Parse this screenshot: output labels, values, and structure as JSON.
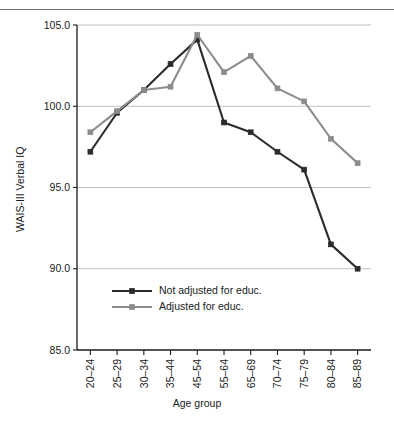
{
  "chart_data": {
    "type": "line",
    "title": "",
    "xlabel": "Age group",
    "ylabel": "WAIS-III Verbal IQ",
    "categories": [
      "20–24",
      "25–29",
      "30–34",
      "35–44",
      "45–54",
      "55–64",
      "65–69",
      "70–74",
      "75–79",
      "80–84",
      "85–89"
    ],
    "ylim": [
      85.0,
      105.0
    ],
    "yticks": [
      85.0,
      90.0,
      95.0,
      100.0,
      105.0
    ],
    "ytick_labels": [
      "85.0",
      "90.0",
      "95.0",
      "100.0",
      "105.0"
    ],
    "grid": true,
    "legend_position": "lower-left-inside",
    "series": [
      {
        "name": "Not adjusted for educ.",
        "color": "#2b2b2b",
        "values": [
          97.2,
          99.6,
          101.0,
          102.6,
          104.1,
          99.0,
          98.4,
          97.2,
          96.1,
          91.5,
          90.0
        ]
      },
      {
        "name": "Adjusted for educ.",
        "color": "#8c8c8c",
        "values": [
          98.4,
          99.7,
          101.0,
          101.2,
          104.4,
          102.1,
          103.1,
          101.1,
          100.3,
          98.0,
          96.5
        ]
      }
    ]
  },
  "legend": {
    "entries": [
      {
        "label": "Not adjusted for educ."
      },
      {
        "label": "Adjusted for educ."
      }
    ]
  },
  "axes": {
    "y_title": "WAIS-III Verbal IQ",
    "x_title": "Age group"
  },
  "colors": {
    "series_dark": "#2b2b2b",
    "series_gray": "#8c8c8c",
    "grid": "#b9b9b9",
    "axis": "#1a1a1a",
    "rule": "#6f6f6f",
    "background": "#ffffff"
  }
}
